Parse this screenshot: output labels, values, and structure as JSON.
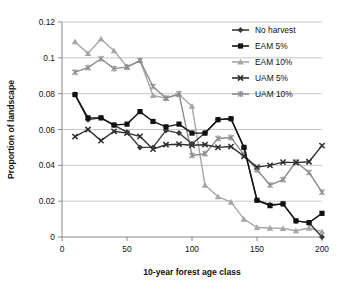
{
  "chart_data": {
    "type": "line",
    "title": "",
    "xlabel": "10-year forest age class",
    "ylabel": "Proportion of landscape",
    "xlim": [
      0,
      200
    ],
    "ylim": [
      0,
      0.12
    ],
    "xticks": [
      0,
      50,
      100,
      150,
      200
    ],
    "xtick_labels": [
      "0",
      "50",
      "100",
      "150",
      "200"
    ],
    "yticks": [
      0,
      0.02,
      0.04,
      0.06,
      0.08,
      0.1,
      0.12
    ],
    "ytick_labels": [
      "0",
      "0.02",
      "0.04",
      "0.06",
      "0.08",
      "0.1",
      "0.12"
    ],
    "grid": "horizontal",
    "legend_position": "top-right",
    "x": [
      10,
      20,
      30,
      40,
      50,
      60,
      70,
      80,
      90,
      100,
      110,
      120,
      130,
      140,
      150,
      160,
      170,
      180,
      190,
      200
    ],
    "series": [
      {
        "name": "No harvest",
        "marker": "diamond",
        "color": "#3b3b3b",
        "values": [
          0.0795,
          0.0655,
          0.0665,
          0.0625,
          0.0585,
          0.05,
          0.05,
          0.0595,
          0.058,
          0.052,
          0.058,
          0.0655,
          0.066,
          0.05,
          0.0205,
          0.018,
          0.0185,
          0.009,
          0.008,
          0.0
        ]
      },
      {
        "name": "EAM 5%",
        "marker": "square",
        "color": "#111111",
        "values": [
          0.0795,
          0.0665,
          0.0665,
          0.0625,
          0.063,
          0.07,
          0.0645,
          0.0615,
          0.063,
          0.058,
          0.058,
          0.0655,
          0.066,
          0.05,
          0.0205,
          0.0175,
          0.0185,
          0.009,
          0.008,
          0.0132
        ]
      },
      {
        "name": "EAM 10%",
        "marker": "triangle",
        "color": "#a6a6a6",
        "values": [
          0.109,
          0.1025,
          0.1105,
          0.104,
          0.095,
          0.0985,
          0.079,
          0.0775,
          0.0795,
          0.073,
          0.029,
          0.0225,
          0.0195,
          0.01,
          0.0053,
          0.005,
          0.0048,
          0.0035,
          0.005,
          0.003
        ]
      },
      {
        "name": "UAM 5%",
        "marker": "x",
        "color": "#2e2e2e",
        "values": [
          0.056,
          0.06,
          0.0538,
          0.059,
          0.058,
          0.0562,
          0.049,
          0.0515,
          0.0518,
          0.0512,
          0.0515,
          0.05,
          0.0505,
          0.045,
          0.039,
          0.04,
          0.0418,
          0.0415,
          0.042,
          0.051
        ]
      },
      {
        "name": "UAM 10%",
        "marker": "asterisk",
        "color": "#8c8c8c",
        "values": [
          0.092,
          0.0945,
          0.0995,
          0.094,
          0.0948,
          0.0985,
          0.084,
          0.0775,
          0.08,
          0.0455,
          0.0465,
          0.055,
          0.0555,
          0.046,
          0.0375,
          0.029,
          0.032,
          0.042,
          0.036,
          0.025
        ]
      }
    ]
  }
}
